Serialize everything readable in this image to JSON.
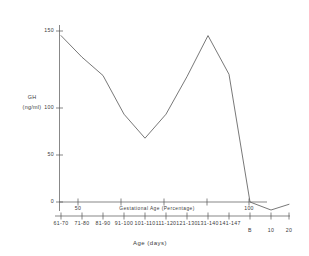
{
  "chart_data": {
    "type": "line",
    "title": "",
    "subtitle": "",
    "ylabel_line1": "GH",
    "ylabel_line2": "(ng/ml)",
    "ylabel": "GH (ng/ml)",
    "xlabel": "Age (days)",
    "secondary_xlabel": "Gestational Age (Percentage)",
    "ylim": [
      0,
      150
    ],
    "yticks": [
      0,
      50,
      100,
      150
    ],
    "ytick_labels": [
      "0",
      "50",
      "100",
      "150"
    ],
    "secondary_xticks": [
      50,
      100
    ],
    "secondary_xtick_labels": [
      "50",
      "100"
    ],
    "grid": false,
    "legend": "none",
    "categories": [
      "61-70",
      "71-80",
      "81-90",
      "91-100",
      "101-110",
      "111-120",
      "121-130",
      "131-140",
      "141-147",
      "B",
      "10",
      "20"
    ],
    "values": [
      146,
      127,
      111,
      77,
      56,
      77,
      110,
      146,
      112,
      0,
      -7,
      -2
    ],
    "series": [
      {
        "name": "GH",
        "values": [
          146,
          127,
          111,
          77,
          56,
          77,
          110,
          146,
          112,
          0,
          -7,
          -2
        ]
      }
    ],
    "points": [
      {
        "x": "61-70",
        "y": 146
      },
      {
        "x": "71-80",
        "y": 127
      },
      {
        "x": "81-90",
        "y": 111
      },
      {
        "x": "91-100",
        "y": 77
      },
      {
        "x": "101-110",
        "y": 56
      },
      {
        "x": "111-120",
        "y": 77
      },
      {
        "x": "121-130",
        "y": 110
      },
      {
        "x": "131-140",
        "y": 146
      },
      {
        "x": "141-147",
        "y": 112
      },
      {
        "x": "B",
        "y": 0
      },
      {
        "x": "10",
        "y": -7
      },
      {
        "x": "20",
        "y": -2
      }
    ],
    "line_color": "#555555",
    "axis_color": "#555555"
  }
}
